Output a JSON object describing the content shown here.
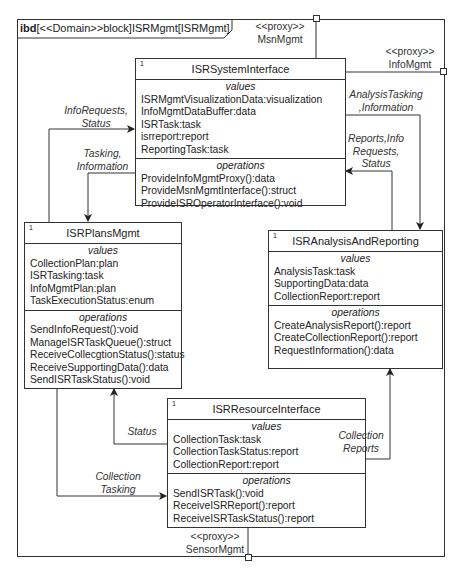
{
  "frame": {
    "kind": "ibd",
    "title_rest": "[<<Domain>>block]ISRMgmt[ISRMgmt]"
  },
  "ports": {
    "msn": {
      "stereotype": "<<proxy>>",
      "name": "MsnMgmt"
    },
    "info": {
      "stereotype": "<<proxy>>",
      "name": "InfoMgmt"
    },
    "sensor": {
      "stereotype": "<<proxy>>",
      "name": "SensorMgmt"
    }
  },
  "blocks": {
    "system": {
      "multiplicity": "1",
      "name": "ISRSystemInterface",
      "values_title": "values",
      "values": [
        "ISRMgmtVisualizationData:visualization",
        "InfoMgmtDataBuffer:data",
        "ISRTask:task",
        "isrreport:report",
        "ReportingTask:task"
      ],
      "operations_title": "operations",
      "operations": [
        "ProvideInfoMgmtProxy():data",
        "ProvideMsnMgmtInterface():struct",
        "ProvideISROperatorInterface():void"
      ]
    },
    "plans": {
      "multiplicity": "1",
      "name": "ISRPlansMgmt",
      "values_title": "values",
      "values": [
        "CollectionPlan:plan",
        "ISRTasking:task",
        "InfoMgmtPlan:plan",
        "TaskExecutionStatus:enum"
      ],
      "operations_title": "operations",
      "operations": [
        "SendInfoRequest():void",
        "ManageISRTaskQueue():struct",
        "ReceiveCollecgtionStatus():status",
        "ReceiveSupportingData():data",
        "SendISRTaskStatus():void"
      ]
    },
    "analysis": {
      "multiplicity": "1",
      "name": "ISRAnalysisAndReporting",
      "values_title": "values",
      "values": [
        "AnalysisTask:task",
        "SupportingData:data",
        "CollectionReport:report"
      ],
      "operations_title": "operations",
      "operations": [
        "CreateAnalysisReport():report",
        "CreateCollectionReport():report",
        "RequestInformation():data"
      ]
    },
    "resource": {
      "multiplicity": "1",
      "name": "ISRResourceInterface",
      "values_title": "values",
      "values": [
        "CollectionTask:task",
        "CollectionTaskStatus:report",
        "CollectionReport:report"
      ],
      "operations_title": "operations",
      "operations": [
        "SendISRTask():void",
        "ReceiveISRReport():report",
        "ReceiveISRTaskStatus():report"
      ]
    }
  },
  "flows": {
    "info_requests": [
      "InfoRequests,",
      "Status"
    ],
    "tasking_info": [
      "Tasking,",
      "Information"
    ],
    "analysis_tasking": [
      "AnalysisTasking",
      ",Information"
    ],
    "reports_info": [
      "Reports,Info",
      "Requests,",
      "Status"
    ],
    "status": [
      "Status"
    ],
    "collection_tasking": [
      "Collection",
      "Tasking"
    ],
    "collection_reports": [
      "Collection",
      "Reports"
    ]
  }
}
